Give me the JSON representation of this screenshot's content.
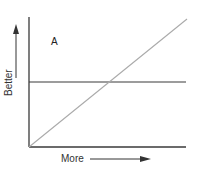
{
  "diagram": {
    "region_label": "A",
    "x_axis_label": "More",
    "y_axis_label": "Better",
    "colors": {
      "axis": "#3a3a3a",
      "horizontal_line": "#3a3a3a",
      "diagonal_line": "#aaaaaa",
      "text": "#333333"
    },
    "elements": [
      {
        "type": "axis",
        "name": "y-axis",
        "from": [
          29,
          17
        ],
        "to": [
          29,
          147
        ]
      },
      {
        "type": "axis",
        "name": "x-axis",
        "from": [
          29,
          147
        ],
        "to": [
          186,
          147
        ]
      },
      {
        "type": "line",
        "name": "horizontal-threshold-line",
        "from": [
          29,
          82
        ],
        "to": [
          186,
          82
        ]
      },
      {
        "type": "line",
        "name": "diagonal-line",
        "from": [
          29,
          147
        ],
        "to": [
          187,
          19
        ]
      },
      {
        "type": "arrow",
        "name": "better-arrow",
        "direction": "up",
        "from": [
          16,
          75
        ],
        "to": [
          16,
          26
        ]
      },
      {
        "type": "arrow",
        "name": "more-arrow",
        "direction": "right",
        "from": [
          90,
          159
        ],
        "to": [
          150,
          159
        ]
      }
    ]
  }
}
